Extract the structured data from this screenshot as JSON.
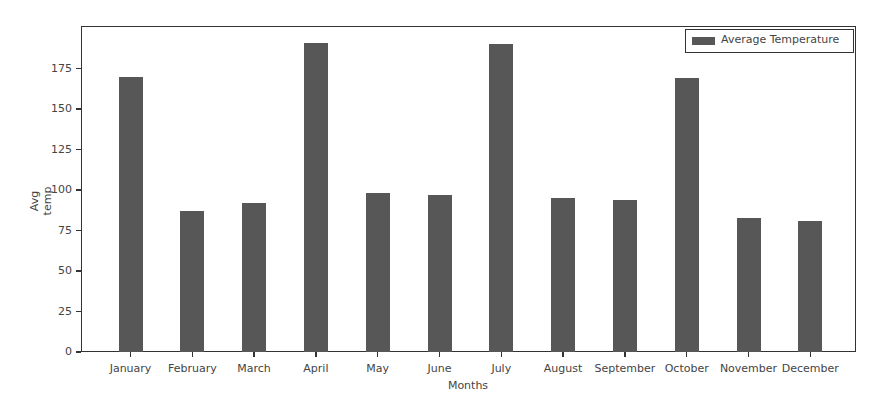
{
  "chart_data": {
    "type": "bar",
    "title": "",
    "xlabel": "Months",
    "ylabel": "Avg temp",
    "categories": [
      "January",
      "February",
      "March",
      "April",
      "May",
      "June",
      "July",
      "August",
      "September",
      "October",
      "November",
      "December"
    ],
    "series": [
      {
        "name": "Average Temperature",
        "color": "#575757",
        "values": [
          170,
          87,
          92,
          191,
          98,
          97,
          190,
          95,
          94,
          169,
          83,
          81
        ]
      }
    ],
    "yticks": [
      "0",
      "25",
      "50",
      "75",
      "100",
      "125",
      "150",
      "175"
    ],
    "ytick_values": [
      0,
      25,
      50,
      75,
      100,
      125,
      150,
      175
    ],
    "ylim": [
      0,
      201
    ],
    "grid": false,
    "legend_position": "upper right"
  },
  "legend": {
    "label": "Average Temperature"
  },
  "axes": {
    "xlabel": "Months",
    "ylabel": "Avg temp"
  }
}
